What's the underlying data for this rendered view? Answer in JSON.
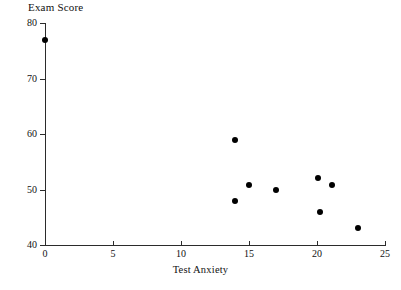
{
  "chart_data": {
    "type": "scatter",
    "title": "Exam Score",
    "xlabel": "Test Anxiety",
    "ylabel": "Exam Score",
    "xlim": [
      0,
      25
    ],
    "ylim": [
      40,
      80
    ],
    "xticks": [
      0,
      5,
      10,
      15,
      20,
      25
    ],
    "yticks": [
      40,
      50,
      60,
      70,
      80
    ],
    "xtick_labels": [
      "0",
      "5",
      "10",
      "15",
      "20",
      "25"
    ],
    "ytick_labels": [
      "40",
      "50",
      "60",
      "70",
      "80"
    ],
    "grid": false,
    "legend": false,
    "marker": "filled-circle",
    "marker_color": "#000000",
    "points": [
      {
        "x": 0,
        "y": 77
      },
      {
        "x": 14,
        "y": 59
      },
      {
        "x": 14,
        "y": 48
      },
      {
        "x": 15,
        "y": 50.8
      },
      {
        "x": 17,
        "y": 50
      },
      {
        "x": 20.1,
        "y": 52
      },
      {
        "x": 20.2,
        "y": 45.9
      },
      {
        "x": 21.1,
        "y": 50.8
      },
      {
        "x": 23,
        "y": 43
      }
    ]
  }
}
